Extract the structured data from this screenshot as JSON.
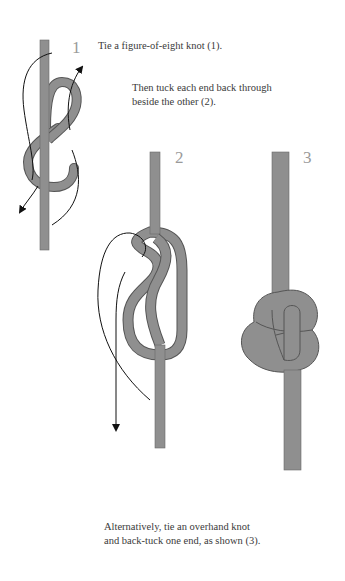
{
  "captions": {
    "step1": "Tie a figure-of-eight knot (1).",
    "step2_line1": "Then tuck each end back through",
    "step2_line2": "beside the other (2).",
    "step3_line1": "Alternatively, tie an overhand knot",
    "step3_line2": "and back-tuck one end, as shown (3)."
  },
  "labels": {
    "fig1": "1",
    "fig2": "2",
    "fig3": "3"
  },
  "colors": {
    "rope": "#8f8f8f",
    "rope_edge": "#555555",
    "arrow": "#111111",
    "label": "#9a9a9a"
  }
}
